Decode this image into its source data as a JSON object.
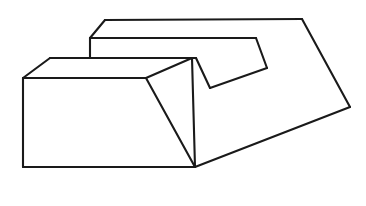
{
  "figure": {
    "title": "Stepped block line drawing",
    "background_color": "#ffffff",
    "line_color": "#1a1a1a",
    "line_width": 2.1,
    "canvas": {
      "width": 366,
      "height": 206
    },
    "vertices": {
      "upper_slab_top_left": [
        90,
        38
      ],
      "upper_slab_top_ridge_left": [
        105,
        20
      ],
      "upper_slab_top_ridge_right": [
        302,
        19
      ],
      "upper_slab_front_left": [
        90,
        38
      ],
      "upper_slab_front_step": [
        256,
        38
      ],
      "upper_slab_notch_right": [
        267,
        68
      ],
      "lower_slab_top_left_corner": [
        50,
        58
      ],
      "lower_slab_left_vertex": [
        23,
        78
      ],
      "lower_slab_bottom_left": [
        23,
        167
      ],
      "lower_slab_bottom_right": [
        195,
        167
      ],
      "lower_slab_front_top_right": [
        146,
        78
      ],
      "lower_slab_ridge_vertex": [
        192,
        58
      ],
      "notch_left_vertex": [
        196,
        58
      ],
      "notch_bottom_vertex": [
        210,
        88
      ],
      "right_far_vertex": [
        350,
        107
      ]
    },
    "faces": [
      {
        "name": "lower-front-face",
        "points": "23,78 146,78 195,167 23,167"
      },
      {
        "name": "lower-right-slope-face",
        "points": "146,78 192,58 195,167"
      },
      {
        "name": "lower-top-face",
        "points": "23,78 50,58 192,58 146,78"
      },
      {
        "name": "upper-top-face",
        "points": "90,38 105,20 302,19 267,68 196,58"
      },
      {
        "name": "upper-front-face",
        "points": "90,38 256,38 267,68 196,58"
      },
      {
        "name": "right-large-face",
        "points": "302,19 350,107 195,167 192,58 196,58 210,88 267,68"
      }
    ],
    "edges": [
      {
        "name": "upper-top-left-diagonal",
        "path": "M 90,38 L 105,20"
      },
      {
        "name": "upper-top-ridge",
        "path": "M 105,20 L 302,19"
      },
      {
        "name": "upper-left-vertical",
        "path": "M 90,38 L 90,58"
      },
      {
        "name": "upper-front-horizontal",
        "path": "M 90,38 L 256,38"
      },
      {
        "name": "upper-front-step-diagonal",
        "path": "M 256,38 L 267,68"
      },
      {
        "name": "notch-right-to-bottom",
        "path": "M 267,68 L 210,88"
      },
      {
        "name": "notch-bottom-to-left",
        "path": "M 210,88 L 196,58"
      },
      {
        "name": "notch-left-to-front",
        "path": "M 196,58 L 90,58"
      },
      {
        "name": "upper-right-descending",
        "path": "M 302,19 L 350,107"
      },
      {
        "name": "right-bottom-descending",
        "path": "M 350,107 L 195,167"
      },
      {
        "name": "lower-top-left-diagonal",
        "path": "M 23,78 L 50,58"
      },
      {
        "name": "lower-top-back-horizontal",
        "path": "M 50,58 L 192,58"
      },
      {
        "name": "lower-ridge-to-front",
        "path": "M 192,58 L 146,78"
      },
      {
        "name": "lower-front-top-horizontal",
        "path": "M 23,78 L 146,78"
      },
      {
        "name": "lower-left-vertical",
        "path": "M 23,78 L 23,167"
      },
      {
        "name": "lower-bottom-horizontal",
        "path": "M 23,167 L 195,167"
      },
      {
        "name": "lower-front-right-slope",
        "path": "M 146,78 L 195,167"
      },
      {
        "name": "lower-ridge-right-slope",
        "path": "M 192,58 L 195,167"
      }
    ]
  }
}
